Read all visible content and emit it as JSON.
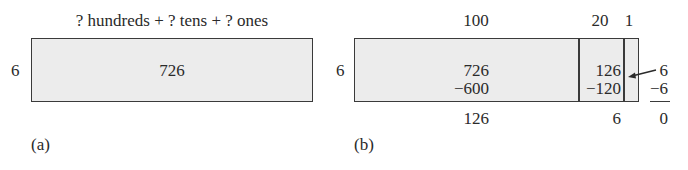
{
  "panel_a": {
    "caption": "(a)",
    "header": "? hundreds + ? tens + ? ones",
    "divisor": "6",
    "dividend": "726"
  },
  "panel_b": {
    "caption": "(b)",
    "divisor": "6",
    "column_headers": [
      "100",
      "20",
      "1"
    ],
    "hundreds_section": {
      "top": "726",
      "subtract": "−600",
      "remainder": "126"
    },
    "tens_section": {
      "top": "126",
      "subtract": "−120",
      "remainder": "6"
    },
    "ones_section": {
      "top": "6",
      "subtract": "−6",
      "remainder": "0"
    }
  },
  "colors": {
    "box_fill": "#ececec",
    "line": "#3a3a3a",
    "text": "#2a2a2a"
  }
}
